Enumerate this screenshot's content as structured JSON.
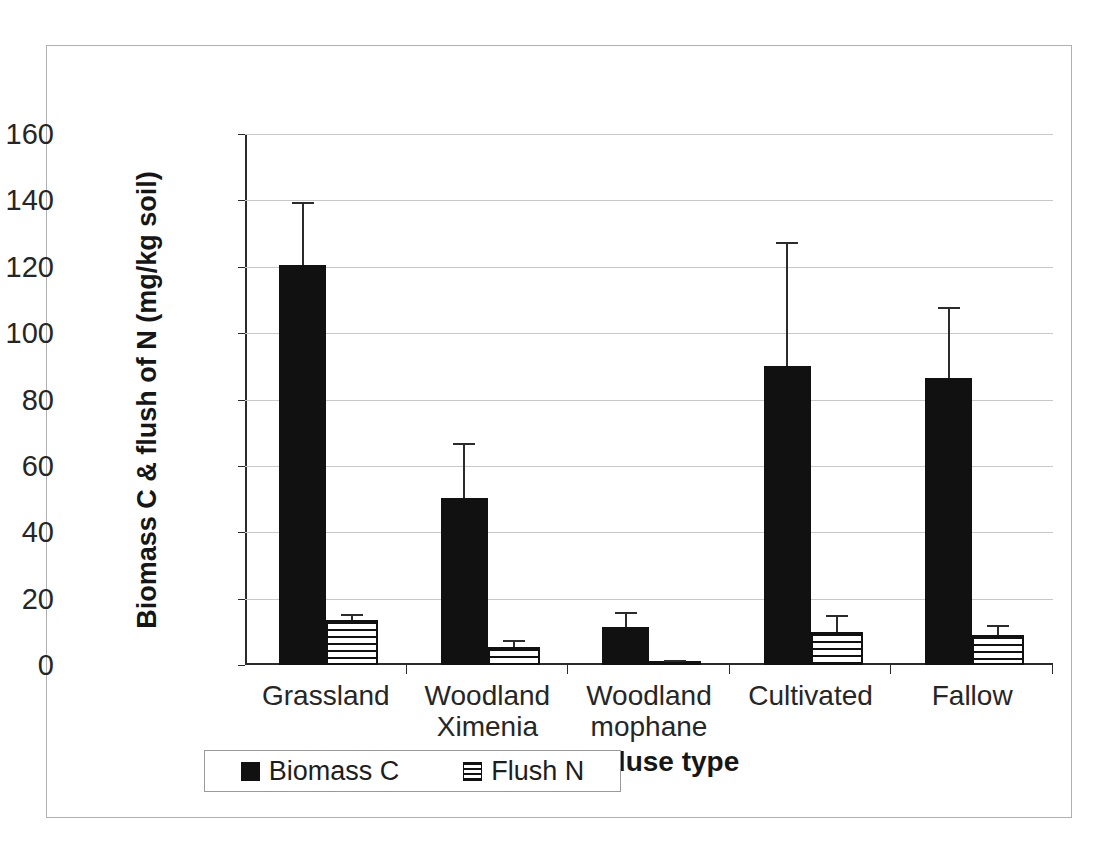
{
  "chart_data": {
    "type": "bar",
    "title": "",
    "xlabel": "Landuse type",
    "ylabel": "Biomass C & flush of N (mg/kg soil)",
    "categories": [
      "Grassland",
      "Woodland Ximenia",
      "Woodland mophane",
      "Cultivated",
      "Fallow"
    ],
    "category_lines": [
      [
        "Grassland"
      ],
      [
        "Woodland",
        "Ximenia"
      ],
      [
        "Woodland",
        "mophane"
      ],
      [
        "Cultivated"
      ],
      [
        "Fallow"
      ]
    ],
    "ylim": [
      0,
      160
    ],
    "yticks": [
      0,
      20,
      40,
      60,
      80,
      100,
      120,
      140,
      160
    ],
    "ytick_labels": [
      "0",
      "20",
      "40",
      "60",
      "80",
      "100",
      "120",
      "140",
      "160"
    ],
    "grid": true,
    "legend_position": "bottom",
    "series": [
      {
        "name": "Biomass C",
        "color": "#111111",
        "fill": "solid",
        "values": [
          120.5,
          50.2,
          11.5,
          90.0,
          86.5
        ],
        "errors_upper": [
          139.5,
          67.0,
          16.0,
          127.5,
          108.0
        ]
      },
      {
        "name": "Flush N",
        "color": "#111111",
        "fill": "horizontal-stripes",
        "values": [
          13.5,
          5.5,
          1.0,
          10.0,
          9.0
        ],
        "errors_upper": [
          15.5,
          7.5,
          1.5,
          15.0,
          12.0
        ]
      }
    ]
  },
  "legend": {
    "entries": [
      {
        "label": "Biomass C"
      },
      {
        "label": "Flush N"
      }
    ]
  }
}
